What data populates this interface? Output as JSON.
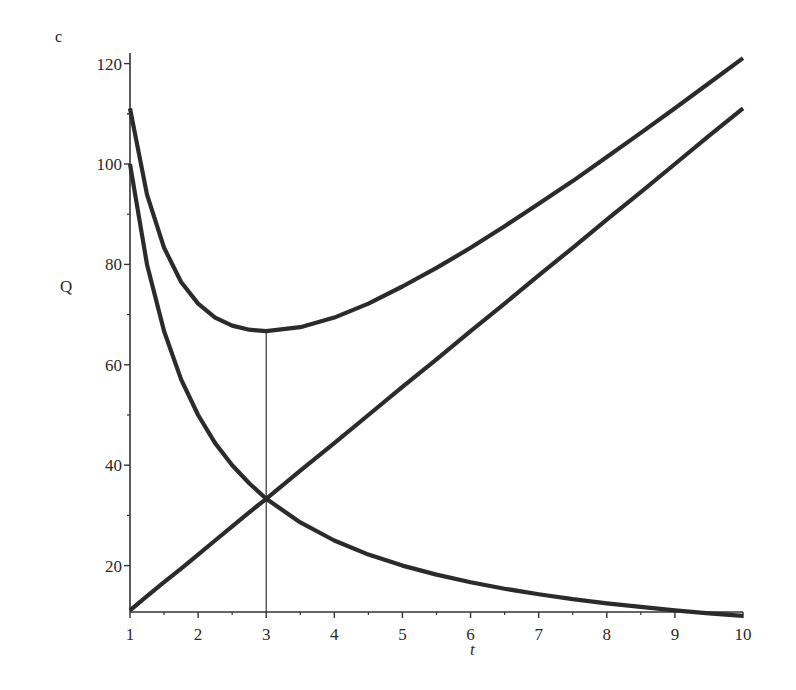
{
  "panel_label": "c",
  "chart_data": {
    "type": "line",
    "title": "",
    "xlabel": "t",
    "ylabel": "Q",
    "xlim": [
      1,
      10
    ],
    "ylim": [
      10.6,
      122
    ],
    "grid": false,
    "legend": null,
    "x_ticks": [
      1,
      2,
      3,
      4,
      5,
      6,
      7,
      8,
      9,
      10
    ],
    "y_ticks": [
      20,
      40,
      60,
      80,
      100,
      120
    ],
    "annotations": [
      {
        "type": "vertical-line",
        "x": 3,
        "from_y": "axis",
        "to_y": 66.7,
        "note": "minimum of total curve"
      }
    ],
    "x": [
      1,
      1.25,
      1.5,
      1.75,
      2,
      2.25,
      2.5,
      2.75,
      3,
      3.5,
      4,
      4.5,
      5,
      5.5,
      6,
      6.5,
      7,
      7.5,
      8,
      8.5,
      9,
      9.5,
      10
    ],
    "series": [
      {
        "name": "decreasing (100/t)",
        "values": [
          100,
          80,
          66.7,
          57.1,
          50,
          44.4,
          40,
          36.4,
          33.3,
          28.6,
          25,
          22.2,
          20,
          18.2,
          16.7,
          15.4,
          14.3,
          13.3,
          12.5,
          11.8,
          11.1,
          10.5,
          10
        ]
      },
      {
        "name": "increasing (100t/9)",
        "values": [
          11.1,
          13.9,
          16.7,
          19.4,
          22.2,
          25,
          27.8,
          30.6,
          33.3,
          38.9,
          44.4,
          50,
          55.6,
          61.1,
          66.7,
          72.2,
          77.8,
          83.3,
          88.9,
          94.4,
          100,
          105.6,
          111.1
        ]
      },
      {
        "name": "total (sum)",
        "values": [
          111.1,
          93.9,
          83.3,
          76.5,
          72.2,
          69.4,
          67.8,
          67,
          66.7,
          67.5,
          69.4,
          72.2,
          75.6,
          79.3,
          83.3,
          87.6,
          92.1,
          96.6,
          101.4,
          106.2,
          111.1,
          116.1,
          121.1
        ]
      }
    ]
  },
  "colors": {
    "curve": "#2b2b2b",
    "axis": "#333333"
  }
}
